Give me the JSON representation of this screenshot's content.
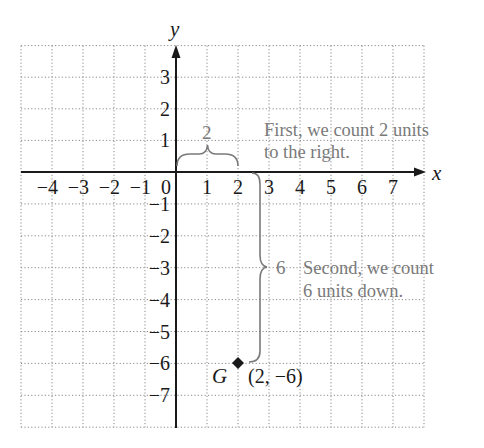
{
  "figure": {
    "top_clipped_text": "",
    "axes": {
      "x_label": "x",
      "y_label": "y",
      "x_range": [
        -5,
        8
      ],
      "y_range": [
        -8,
        4
      ]
    },
    "x_tick_labels": [
      "−4",
      "−3",
      "−2",
      "−1",
      "0",
      "1",
      "2",
      "3",
      "4",
      "5",
      "6",
      "7"
    ],
    "x_tick_values": [
      -4,
      -3,
      -2,
      -1,
      0,
      1,
      2,
      3,
      4,
      5,
      6,
      7
    ],
    "y_tick_labels": [
      "3",
      "2",
      "1",
      "−1",
      "−2",
      "−3",
      "−4",
      "−5",
      "−6",
      "−7"
    ],
    "y_tick_values": [
      3,
      2,
      1,
      -1,
      -2,
      -3,
      -4,
      -5,
      -6,
      -7
    ],
    "horizontal_brace_label": "2",
    "horizontal_annotation": [
      "First, we count 2 units",
      "to the right."
    ],
    "vertical_brace_label": "6",
    "vertical_annotation": [
      "Second, we count",
      "6 units down."
    ],
    "point": {
      "name": "G",
      "coords_label": "(2, −6)",
      "x": 2,
      "y": -6
    },
    "colors": {
      "axis": "#1a1a1a",
      "grid": "#8a8a8a",
      "annotation": "#7a7a7a",
      "text": "#1a1a1a"
    }
  }
}
